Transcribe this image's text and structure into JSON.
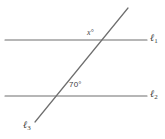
{
  "figure": {
    "background_color": "#ffffff",
    "stroke_color": "#6e6e6e",
    "text_color": "#3a3a3a",
    "labels": {
      "angle_x": "x°",
      "angle_known": "70°",
      "line1_name": "ℓ",
      "line1_sub": "1",
      "line2_name": "ℓ",
      "line2_sub": "2",
      "line3_name": "ℓ",
      "line3_sub": "3"
    },
    "geometry": {
      "line1": {
        "x1": 5,
        "y1": 40,
        "x2": 147,
        "y2": 40
      },
      "line2": {
        "x1": 5,
        "y1": 96,
        "x2": 147,
        "y2": 96
      },
      "line3": {
        "x1": 35,
        "y1": 122,
        "x2": 128,
        "y2": 8
      },
      "intersection_upper": {
        "x": 98,
        "y": 40
      },
      "intersection_lower": {
        "x": 55,
        "y": 96
      }
    },
    "chart_data": {
      "type": "diagram",
      "title": "Two parallel lines cut by a transversal",
      "elements": [
        {
          "name": "ℓ1",
          "kind": "line",
          "orientation": "horizontal",
          "y": 40
        },
        {
          "name": "ℓ2",
          "kind": "line",
          "orientation": "horizontal",
          "y": 96
        },
        {
          "name": "ℓ3",
          "kind": "transversal",
          "angle_deg": 70
        }
      ],
      "angles": [
        {
          "label": "x°",
          "value": null,
          "at": "upper intersection",
          "position": "upper-left"
        },
        {
          "label": "70°",
          "value": 70,
          "at": "lower intersection",
          "position": "upper-right"
        }
      ]
    }
  }
}
